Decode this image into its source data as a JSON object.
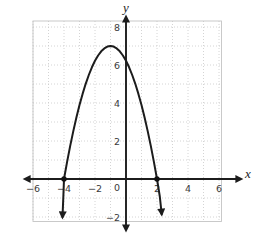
{
  "chart_data": {
    "type": "line",
    "title": "",
    "xlabel": "x",
    "ylabel": "y",
    "grid": true,
    "xlim": [
      -6.5,
      6.6
    ],
    "ylim": [
      -2.6,
      8.6
    ],
    "x_tick_labels": [
      -6,
      -4,
      -2,
      0,
      2,
      4,
      6
    ],
    "y_tick_labels": [
      8,
      6,
      4,
      2,
      -2
    ],
    "series": [
      {
        "name": "downward-parabola",
        "opens": "down",
        "vertex": [
          -1,
          7
        ],
        "x_intercepts": [
          [
            -4,
            0
          ],
          [
            2,
            0
          ]
        ],
        "y_intercept_approx": [
          0,
          6.2
        ],
        "arrow_ends": [
          [
            -4.1,
            -2.0
          ],
          [
            2.3,
            -1.85
          ]
        ],
        "marked_points": [
          [
            -4,
            0
          ],
          [
            2,
            0
          ]
        ]
      }
    ],
    "colors": {
      "curve": "#1c1c1c",
      "axis": "#1c1c1c",
      "grid": "#c9c9c9",
      "grid_border": "#c4c4c4",
      "tick_label": "#3a3a3a",
      "point": "#111111",
      "background": "#ffffff"
    }
  }
}
